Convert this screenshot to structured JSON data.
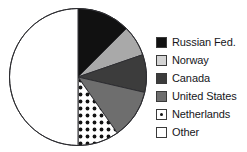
{
  "chart_data": {
    "type": "pie",
    "title": "",
    "subtitle": "",
    "xlabel": "",
    "ylabel": "",
    "legend_position": "right",
    "grid": false,
    "start_angle_deg": 0,
    "direction": "clockwise",
    "categories": [
      "Russian Fed.",
      "Norway",
      "Canada",
      "United States",
      "Netherlands",
      "Other"
    ],
    "values": [
      12.5,
      7.2,
      8.9,
      11.7,
      9.7,
      50.0
    ],
    "slices": [
      {
        "label": "Russian Fed.",
        "value": 12.5,
        "start_deg": 0,
        "end_deg": 45,
        "color": "#111111",
        "pattern": "solid"
      },
      {
        "label": "Norway",
        "value": 7.2,
        "start_deg": 45,
        "end_deg": 71,
        "color": "#a9a9a9",
        "pattern": "solid"
      },
      {
        "label": "Canada",
        "value": 8.9,
        "start_deg": 71,
        "end_deg": 103,
        "color": "#3c3c3c",
        "pattern": "solid"
      },
      {
        "label": "United States",
        "value": 11.7,
        "start_deg": 103,
        "end_deg": 145,
        "color": "#6e6e6e",
        "pattern": "solid"
      },
      {
        "label": "Netherlands",
        "value": 9.7,
        "start_deg": 145,
        "end_deg": 180,
        "color": "#ffffff",
        "pattern": "polka-dots"
      },
      {
        "label": "Other",
        "value": 50.0,
        "start_deg": 180,
        "end_deg": 360,
        "color": "#ffffff",
        "pattern": "solid"
      }
    ],
    "geometry": {
      "cx": 78,
      "cy": 77,
      "r": 68.5,
      "outline_color": "#2e2e32",
      "outline_width": 1
    }
  },
  "legend": {
    "items": [
      {
        "label": "Russian Fed.",
        "color": "#111111",
        "pattern": "solid",
        "icon": "legend-swatch-russian-fed"
      },
      {
        "label": "Norway",
        "color": "#d4d4d4",
        "pattern": "solid",
        "icon": "legend-swatch-norway"
      },
      {
        "label": "Canada",
        "color": "#3c3c3c",
        "pattern": "solid",
        "icon": "legend-swatch-canada"
      },
      {
        "label": "United States",
        "color": "#6e6e6e",
        "pattern": "solid",
        "icon": "legend-swatch-united-states"
      },
      {
        "label": "Netherlands",
        "color": "#ffffff",
        "pattern": "polka-dots",
        "icon": "legend-swatch-netherlands"
      },
      {
        "label": "Other",
        "color": "#ffffff",
        "pattern": "solid",
        "icon": "legend-swatch-other"
      }
    ]
  }
}
